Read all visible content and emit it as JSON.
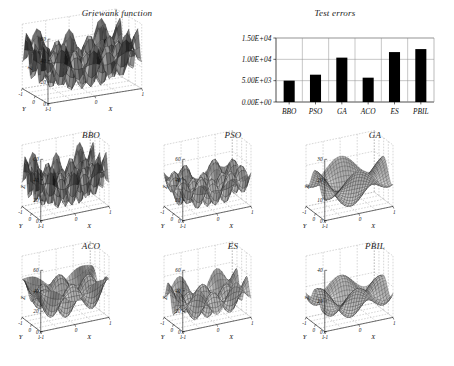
{
  "figure": {
    "background": "#ffffff",
    "ink": "#000000"
  },
  "chart_data": [
    {
      "type": "surface",
      "name": "griewank-reference",
      "title": "Griewank function",
      "xlabel": "X",
      "ylabel": "Y",
      "zlabel": "Z",
      "xticks": [
        "-1",
        "0",
        "1"
      ],
      "yticks": [
        "1",
        "0",
        "-1"
      ],
      "zticks": [
        "0",
        "20",
        "40",
        "60"
      ],
      "zlim": [
        0,
        60
      ],
      "xlim": [
        -1,
        1
      ],
      "ylim": [
        -1,
        1
      ],
      "grid": true,
      "amplitude": 55,
      "waves": 3.0,
      "style": "mesh-shaded"
    },
    {
      "type": "bar",
      "name": "test-errors",
      "title": "Test errors",
      "categories": [
        "BBO",
        "PSO",
        "GA",
        "ACO",
        "ES",
        "PBIL"
      ],
      "values": [
        5000,
        6400,
        10400,
        5700,
        11700,
        12400
      ],
      "ytick_labels": [
        "0.00E+00",
        "5.00E+03",
        "1.00E+04",
        "1.50E+04"
      ],
      "ytick_values": [
        0,
        5000,
        10000,
        15000
      ],
      "ylim": [
        0,
        15000
      ],
      "xlabel": "",
      "ylabel": "",
      "grid": true,
      "bar_color": "#000000"
    },
    {
      "type": "surface",
      "name": "bbo-surface",
      "title": "BBO",
      "xlabel": "X",
      "ylabel": "Y",
      "zlabel": "Z",
      "xticks": [
        "-1",
        "0",
        "1"
      ],
      "yticks": [
        "1",
        "0",
        "-1"
      ],
      "zticks": [
        "0",
        "20",
        "40",
        "60"
      ],
      "zlim": [
        0,
        60
      ],
      "amplitude": 52,
      "waves": 3.0,
      "style": "mesh-shaded"
    },
    {
      "type": "surface",
      "name": "pso-surface",
      "title": "PSO",
      "xlabel": "X",
      "ylabel": "Y",
      "zlabel": "Z",
      "xticks": [
        "-1",
        "0",
        "1"
      ],
      "yticks": [
        "1",
        "0",
        "-1"
      ],
      "zticks": [
        "0",
        "20",
        "40",
        "60"
      ],
      "zlim": [
        0,
        60
      ],
      "amplitude": 44,
      "waves": 2.4,
      "style": "mesh-shaded"
    },
    {
      "type": "surface",
      "name": "ga-surface",
      "title": "GA",
      "xlabel": "X",
      "ylabel": "Y",
      "zlabel": "Z",
      "xticks": [
        "-1",
        "0",
        "1"
      ],
      "yticks": [
        "1",
        "0",
        "-1"
      ],
      "zticks": [
        "0",
        "10",
        "20",
        "30"
      ],
      "zlim": [
        0,
        30
      ],
      "amplitude": 24,
      "waves": 1.0,
      "style": "mesh-shaded"
    },
    {
      "type": "surface",
      "name": "aco-surface",
      "title": "ACO",
      "xlabel": "X",
      "ylabel": "Y",
      "zlabel": "Z",
      "xticks": [
        "-1",
        "0",
        "1"
      ],
      "yticks": [
        "1",
        "0",
        "-1"
      ],
      "zticks": [
        "0",
        "20",
        "40",
        "60"
      ],
      "zlim": [
        0,
        60
      ],
      "amplitude": 50,
      "waves": 1.6,
      "style": "mesh-shaded"
    },
    {
      "type": "surface",
      "name": "es-surface",
      "title": "ES",
      "xlabel": "X",
      "ylabel": "Y",
      "zlabel": "Z",
      "xticks": [
        "-1",
        "0",
        "1"
      ],
      "yticks": [
        "1",
        "0",
        "-1"
      ],
      "zticks": [
        "0",
        "20",
        "40",
        "60"
      ],
      "zlim": [
        0,
        60
      ],
      "amplitude": 40,
      "waves": 1.9,
      "style": "mesh-shaded"
    },
    {
      "type": "surface",
      "name": "pbil-surface",
      "title": "PBIL",
      "xlabel": "X",
      "ylabel": "Y",
      "zlabel": "Z",
      "xticks": [
        "-1",
        "0",
        "1"
      ],
      "yticks": [
        "1",
        "0",
        "-1"
      ],
      "zticks": [
        "0",
        "20",
        "40"
      ],
      "zlim": [
        0,
        40
      ],
      "amplitude": 28,
      "waves": 1.2,
      "style": "mesh-shaded"
    }
  ]
}
